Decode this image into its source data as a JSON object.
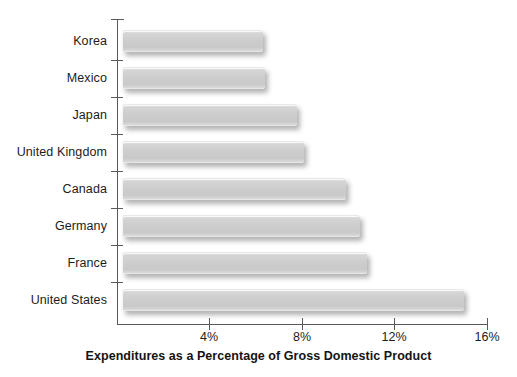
{
  "chart_data": {
    "type": "bar",
    "orientation": "horizontal",
    "title": "",
    "xlabel": "Expenditures as a Percentage of Gross Domestic Product",
    "ylabel": "",
    "categories": [
      "Korea",
      "Mexico",
      "Japan",
      "United Kingdom",
      "Canada",
      "Germany",
      "France",
      "United States"
    ],
    "values": [
      6.3,
      6.4,
      7.8,
      8.1,
      9.9,
      10.5,
      10.8,
      15.0
    ],
    "value_unit": "%",
    "xlim": [
      0,
      16
    ],
    "xticks": [
      4,
      8,
      12,
      16
    ],
    "xtick_labels": [
      "4%",
      "8%",
      "12%",
      "16%"
    ],
    "grid": false,
    "legend": false,
    "series": [
      {
        "name": "Health expenditures",
        "values": [
          6.3,
          6.4,
          7.8,
          8.1,
          9.9,
          10.5,
          10.8,
          15.0
        ]
      }
    ],
    "bar_color": "#cdcdcd",
    "axis_color": "#5a5a5a",
    "text_color": "#1c1c1c",
    "background": "#ffffff"
  }
}
